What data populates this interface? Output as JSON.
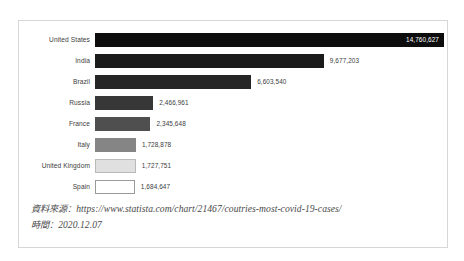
{
  "chart_data": {
    "type": "bar",
    "orientation": "horizontal",
    "title": "",
    "xlabel": "",
    "ylabel": "",
    "grid": false,
    "legend": null,
    "axis_visible": false,
    "xlim": [
      0,
      14760627
    ],
    "categories": [
      "United States",
      "India",
      "Brazil",
      "Russia",
      "France",
      "Italy",
      "United Kingdom",
      "Spain"
    ],
    "values": [
      14760627,
      9677203,
      6603540,
      2466961,
      2345648,
      1728878,
      1727751,
      1684647
    ],
    "value_labels": [
      "14,760,627",
      "9,677,203",
      "6,603,540",
      "2,466,961",
      "2,345,648",
      "1,728,878",
      "1,727,751",
      "1,684,647"
    ],
    "bar_colors": [
      "#0d0d0d",
      "#1b1b1b",
      "#262626",
      "#373737",
      "#4f4f4f",
      "#858585",
      "#e0e0e0",
      "#ffffff"
    ],
    "bar_border_colors": [
      "#0d0d0d",
      "#1b1b1b",
      "#262626",
      "#373737",
      "#4f4f4f",
      "#858585",
      "#b9b9b9",
      "#9a9a9a"
    ],
    "label_inside_flags": [
      true,
      false,
      false,
      false,
      false,
      false,
      false,
      false
    ]
  },
  "footer": {
    "source_label": "資料來源：",
    "source_url": "https://www.statista.com/chart/21467/coutries-most-covid-19-cases/",
    "time_label": "時間：",
    "time_value": "2020.12.07"
  },
  "colors": {
    "frame_border": "#d6d6d6",
    "text": "#3c3c3c",
    "footer_text": "#4a4a4a",
    "background": "#ffffff"
  }
}
